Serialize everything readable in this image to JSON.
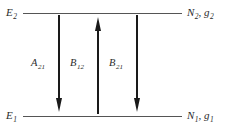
{
  "diagram": {
    "type": "energy-level-diagram",
    "levels": [
      {
        "id": "upper",
        "left_label": "E",
        "left_sub": "2",
        "right_label": "N",
        "right_sub": "2",
        "right_label2": ", g",
        "right_sub2": "2"
      },
      {
        "id": "lower",
        "left_label": "E",
        "left_sub": "1",
        "right_label": "N",
        "right_sub": "1",
        "right_label2": ", g",
        "right_sub2": "1"
      }
    ],
    "transitions": [
      {
        "id": "a21",
        "symbol": "A",
        "sub": "21",
        "direction": "down"
      },
      {
        "id": "b12",
        "symbol": "B",
        "sub": "12",
        "direction": "up"
      },
      {
        "id": "b21",
        "symbol": "B",
        "sub": "21",
        "direction": "down"
      }
    ],
    "colors": {
      "level_line": "#555555",
      "arrow": "#1a1a1a",
      "text": "#2b2b2b",
      "background": "#ffffff"
    }
  }
}
